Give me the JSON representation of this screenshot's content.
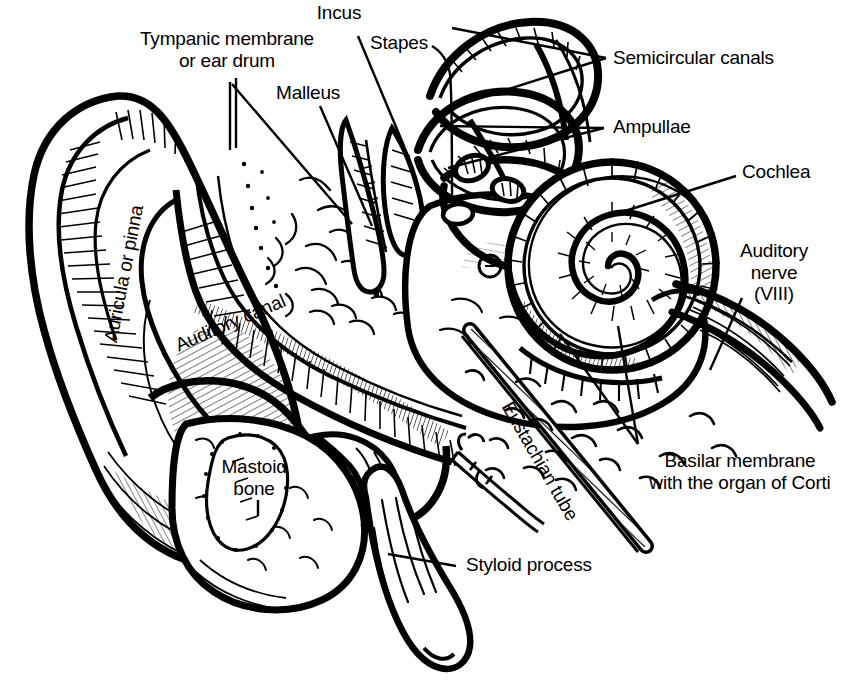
{
  "figure": {
    "subject": "ear",
    "style": "black-and-white line engraving / hatched medical illustration",
    "background_color": "#ffffff",
    "ink_color": "#000000",
    "width": 844,
    "height": 688
  },
  "labels": {
    "incus": "Incus",
    "tympanic": "Tympanic membrane\nor ear drum",
    "malleus": "Malleus",
    "stapes": "Stapes",
    "semicircular": "Semicircular canals",
    "ampullae": "Ampullae",
    "cochlea": "Cochlea",
    "auditory_nerve": "Auditory\nnerve\n(VIII)",
    "basilar": "Basilar membrane\nwith the organ of Corti",
    "styloid": "Styloid process",
    "mastoid": "Mastoid\nbone",
    "auricula": "Auricula or pinna",
    "auditory_canal": "Auditory canal",
    "eustachian": "Eustachian tube"
  },
  "structures": [
    {
      "name": "Incus",
      "region": "middle ear",
      "leader": "line"
    },
    {
      "name": "Tympanic membrane or ear drum",
      "region": "middle ear",
      "leader": "line"
    },
    {
      "name": "Malleus",
      "region": "middle ear",
      "leader": "line"
    },
    {
      "name": "Stapes",
      "region": "middle ear",
      "leader": "hook"
    },
    {
      "name": "Semicircular canals",
      "region": "inner ear",
      "leader": "converging-pair"
    },
    {
      "name": "Ampullae",
      "region": "inner ear",
      "leader": "converging-pair"
    },
    {
      "name": "Cochlea",
      "region": "inner ear",
      "leader": "line"
    },
    {
      "name": "Auditory nerve (VIII)",
      "region": "inner ear",
      "leader": "line"
    },
    {
      "name": "Basilar membrane with the organ of Corti",
      "region": "inner ear",
      "leader": "converging-pair"
    },
    {
      "name": "Styloid process",
      "region": "temporal bone",
      "leader": "line"
    },
    {
      "name": "Mastoid bone",
      "region": "temporal bone",
      "leader": "none"
    },
    {
      "name": "Auricula or pinna",
      "region": "outer ear",
      "leader": "none"
    },
    {
      "name": "Auditory canal",
      "region": "outer ear",
      "leader": "none"
    },
    {
      "name": "Eustachian tube",
      "region": "middle ear",
      "leader": "none"
    }
  ]
}
